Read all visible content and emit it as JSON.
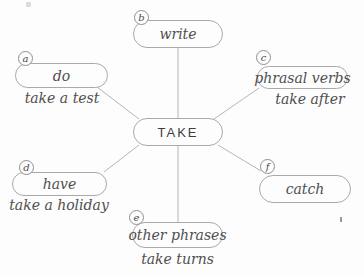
{
  "diagram": {
    "center": {
      "label": "TAKE"
    },
    "nodes": [
      {
        "letter": "a",
        "label": "do",
        "example": "take a test"
      },
      {
        "letter": "b",
        "label": "write",
        "example": ""
      },
      {
        "letter": "c",
        "label": "phrasal verbs",
        "example": "take after"
      },
      {
        "letter": "d",
        "label": "have",
        "example": "take a holiday"
      },
      {
        "letter": "e",
        "label": "other phrases",
        "example": "take turns"
      },
      {
        "letter": "f",
        "label": "catch",
        "example": ""
      }
    ],
    "colors": {
      "background": "#fdfdfd",
      "node_border": "#a9a9a9",
      "connector_line": "#b6b6b6",
      "text": "#4f4f4f",
      "center_text": "#3d3d3d"
    }
  }
}
